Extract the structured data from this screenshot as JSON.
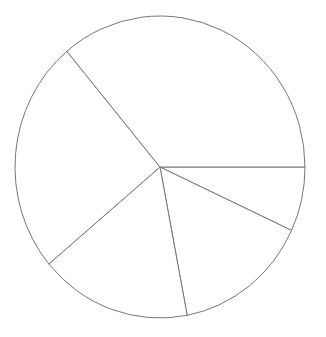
{
  "chart_data": {
    "type": "pie",
    "title": "",
    "labels": [
      "",
      "",
      "",
      "",
      ""
    ],
    "values": [
      6.9,
      15.1,
      16.9,
      25.0,
      36.1
    ],
    "start_angle_deg": 0,
    "direction": "clockwise",
    "legend": "none",
    "fill_color": "#ffffff",
    "stroke_color": "#777777",
    "center": [
      160,
      167
    ],
    "radius_x": 145,
    "radius_y": 151
  }
}
